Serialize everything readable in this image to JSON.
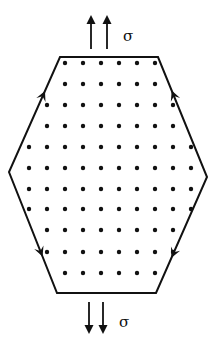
{
  "diagram": {
    "type": "hexagonal crystal grain under uniaxial stress",
    "colors": {
      "ink": "#111111",
      "background": "#ffffff"
    },
    "hexagon": {
      "vertices": [
        [
          60,
          57
        ],
        [
          158,
          57
        ],
        [
          207,
          177
        ],
        [
          156,
          293
        ],
        [
          57,
          293
        ],
        [
          9,
          172
        ]
      ]
    },
    "stress_labels": {
      "top": "σ",
      "bottom": "σ"
    },
    "stress_arrows": {
      "top": {
        "direction": "up",
        "xs": [
          91,
          107
        ],
        "y_tip": 15,
        "y_tail": 49
      },
      "bottom": {
        "direction": "down",
        "xs": [
          89,
          103
        ],
        "y_tail": 302,
        "y_tip": 334
      }
    },
    "edge_arrows": [
      {
        "edge": "upper-left",
        "direction": "up",
        "x": 43,
        "y": 90
      },
      {
        "edge": "upper-right",
        "direction": "up",
        "x": 173,
        "y": 90
      },
      {
        "edge": "lower-left",
        "direction": "down",
        "x": 44,
        "y": 256
      },
      {
        "edge": "lower-right",
        "direction": "down",
        "x": 172,
        "y": 258
      }
    ],
    "lattice": {
      "dot_radius": 2.2,
      "col_spacing": 18,
      "rows": [
        {
          "y": 63,
          "count": 6,
          "x0": 65
        },
        {
          "y": 84,
          "count": 6,
          "x0": 65
        },
        {
          "y": 105,
          "count": 8,
          "x0": 47
        },
        {
          "y": 126,
          "count": 8,
          "x0": 47
        },
        {
          "y": 147,
          "count": 10,
          "x0": 29
        },
        {
          "y": 168,
          "count": 10,
          "x0": 29
        },
        {
          "y": 189,
          "count": 10,
          "x0": 29
        },
        {
          "y": 209,
          "count": 10,
          "x0": 29
        },
        {
          "y": 230,
          "count": 8,
          "x0": 47
        },
        {
          "y": 252,
          "count": 8,
          "x0": 47
        },
        {
          "y": 273,
          "count": 6,
          "x0": 65
        }
      ]
    }
  }
}
